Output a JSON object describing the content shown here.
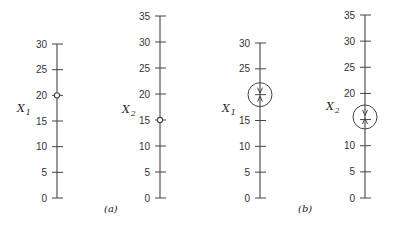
{
  "colors": {
    "ink": "#444444",
    "text": "#333333",
    "background": "#ffffff"
  },
  "panels": [
    {
      "id": "a",
      "label": "(a)",
      "label_pos": [
        104,
        212
      ],
      "axes": [
        {
          "name": "X",
          "sub": "1",
          "x": 57,
          "y0": 198,
          "ytop": 44,
          "max": 30,
          "ticks": [
            0,
            5,
            10,
            15,
            20,
            25,
            30
          ],
          "tick_labels": [
            "0",
            "5",
            "10",
            "15",
            "20",
            "25",
            "30"
          ],
          "label_pos": [
            17,
            112
          ],
          "marker": {
            "type": "open-circle",
            "value": 20
          }
        },
        {
          "name": "X",
          "sub": "2",
          "x": 160,
          "y0": 198,
          "ytop": 16,
          "max": 35,
          "ticks": [
            0,
            5,
            10,
            15,
            20,
            25,
            30,
            35
          ],
          "tick_labels": [
            "0",
            "5",
            "10",
            "15",
            "20",
            "25",
            "30",
            "35"
          ],
          "label_pos": [
            122,
            113
          ],
          "marker": {
            "type": "open-circle",
            "value": 15
          }
        }
      ]
    },
    {
      "id": "b",
      "label": "(b)",
      "label_pos": [
        298,
        212
      ],
      "axes": [
        {
          "name": "X",
          "sub": "1",
          "x": 260,
          "y0": 198,
          "ytop": 43,
          "max": 30,
          "ticks": [
            0,
            5,
            10,
            15,
            20,
            25,
            30
          ],
          "tick_labels": [
            "0",
            "5",
            "10",
            "15",
            "",
            "25",
            "30"
          ],
          "label_pos": [
            222,
            112
          ],
          "marker": {
            "type": "converging-circle",
            "value": 20,
            "radius": 12
          }
        },
        {
          "name": "X",
          "sub": "2",
          "x": 365,
          "y0": 198,
          "ytop": 15,
          "max": 35,
          "ticks": [
            0,
            5,
            10,
            15,
            20,
            25,
            30,
            35
          ],
          "tick_labels": [
            "0",
            "5",
            "10",
            "",
            "20",
            "25",
            "30",
            "35"
          ],
          "label_pos": [
            326,
            110
          ],
          "marker": {
            "type": "converging-circle",
            "value": 15.5,
            "radius": 12
          }
        }
      ]
    }
  ]
}
